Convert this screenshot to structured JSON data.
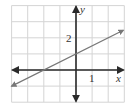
{
  "chart_data": {
    "type": "line",
    "title": "",
    "xlabel": "x",
    "ylabel": "y",
    "xlim": [
      -4,
      3
    ],
    "ylim": [
      -2,
      4
    ],
    "grid": true,
    "grid_step": 1,
    "tick_labels": {
      "x": [
        {
          "value": 1,
          "label": "1"
        }
      ],
      "y": [
        {
          "value": 2,
          "label": "2"
        }
      ]
    },
    "series": [
      {
        "name": "line",
        "equation": "y = 0.5x + 1",
        "slope": 0.5,
        "intercept": 1,
        "x": [
          -4,
          -2,
          0,
          3
        ],
        "y": [
          -1,
          0,
          1,
          2.5
        ],
        "arrows": "both"
      }
    ],
    "legend": null
  },
  "colors": {
    "grid": "#d4d4d4",
    "axis": "#2a2a2a",
    "line": "#777777",
    "text": "#333333"
  },
  "labels": {
    "x_axis": "x",
    "y_axis": "y",
    "x_tick_1": "1",
    "y_tick_2": "2"
  }
}
